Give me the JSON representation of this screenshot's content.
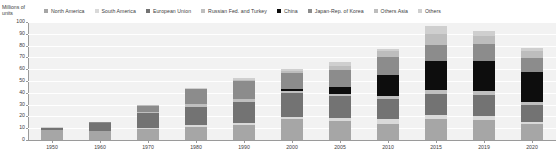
{
  "chart_data": {
    "type": "bar",
    "title": "",
    "subtitle": "",
    "ylabel": "Millions of units",
    "xlabel": "",
    "ylim": [
      0,
      100
    ],
    "ytick_step": 10,
    "yticks": [
      0,
      10,
      20,
      30,
      40,
      50,
      60,
      70,
      80,
      90,
      100
    ],
    "grid": true,
    "stacked": true,
    "legend_position": "top",
    "categories": [
      "1950",
      "1960",
      "1970",
      "1980",
      "1990",
      "2000",
      "2005",
      "2010",
      "2015",
      "2019",
      "2020"
    ],
    "series": [
      {
        "name": "North America",
        "color": "#a6a6a6",
        "values": [
          8.3,
          7.9,
          9.5,
          11.0,
          13.0,
          17.7,
          16.4,
          13.4,
          17.9,
          16.8,
          13.4
        ]
      },
      {
        "name": "South America",
        "color": "#d9d9d9",
        "values": [
          0.0,
          0.1,
          0.6,
          1.4,
          1.1,
          2.0,
          2.6,
          4.3,
          3.3,
          3.2,
          2.1
        ]
      },
      {
        "name": "European Union",
        "color": "#737373",
        "values": [
          1.8,
          6.1,
          12.4,
          15.5,
          18.4,
          20.0,
          18.2,
          17.1,
          18.2,
          18.5,
          14.2
        ]
      },
      {
        "name": "Russian Fed. and Turkey",
        "color": "#bfbfbf",
        "values": [
          0.4,
          0.6,
          1.0,
          2.5,
          2.2,
          1.6,
          1.9,
          2.4,
          2.7,
          3.1,
          2.8
        ]
      },
      {
        "name": "China",
        "color": "#0d0d0d",
        "values": [
          0.0,
          0.0,
          0.1,
          0.2,
          0.5,
          2.1,
          5.7,
          18.3,
          24.5,
          25.7,
          25.2
        ]
      },
      {
        "name": "Japan-Rep. of Korea",
        "color": "#8c8c8c",
        "values": [
          0.1,
          0.6,
          5.5,
          12.3,
          14.7,
          13.5,
          14.4,
          14.8,
          13.8,
          13.7,
          11.8
        ]
      },
      {
        "name": "Others Asia",
        "color": "#bdbdbd",
        "values": [
          0.0,
          0.1,
          0.3,
          0.7,
          1.3,
          2.0,
          3.5,
          5.6,
          9.3,
          7.4,
          5.9
        ]
      },
      {
        "name": "Others",
        "color": "#cfcfcf",
        "values": [
          0.1,
          0.1,
          0.2,
          0.5,
          1.1,
          1.3,
          3.2,
          1.5,
          7.2,
          3.7,
          2.5
        ]
      }
    ]
  },
  "legend": {
    "items": [
      {
        "label": "North America",
        "color": "#a6a6a6"
      },
      {
        "label": "South America",
        "color": "#d9d9d9"
      },
      {
        "label": "European Union",
        "color": "#737373"
      },
      {
        "label": "Russian Fed. and Turkey",
        "color": "#bfbfbf"
      },
      {
        "label": "China",
        "color": "#0d0d0d"
      },
      {
        "label": "Japan-Rep. of Korea",
        "color": "#8c8c8c"
      },
      {
        "label": "Others Asia",
        "color": "#bdbdbd"
      },
      {
        "label": "Others",
        "color": "#cfcfcf"
      }
    ]
  },
  "axis": {
    "y_title_line1": "Millions of",
    "y_title_line2": "units"
  },
  "colors": {
    "plot_background": "#f2f2f2",
    "gridline": "#ffffff",
    "axis": "#9a9a9a",
    "text": "#3d3d3d",
    "page_background": "#ffffff"
  }
}
